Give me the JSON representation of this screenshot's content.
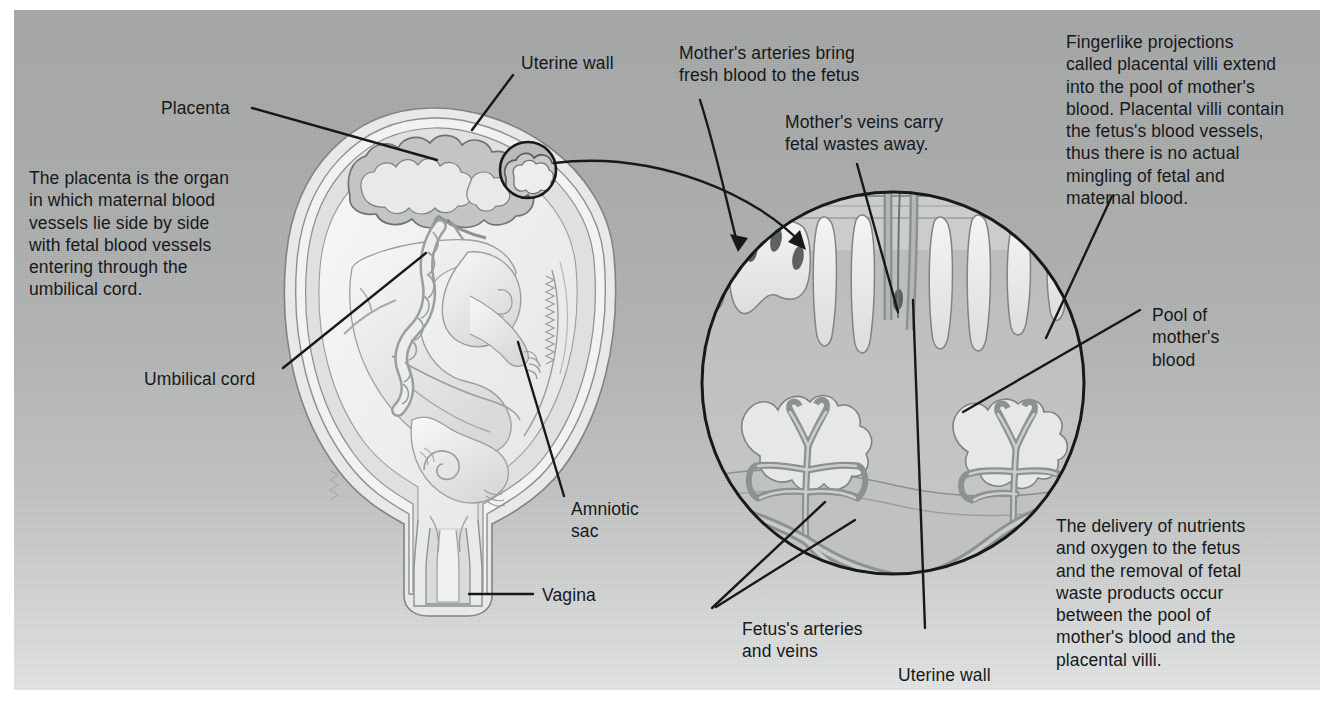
{
  "figure": {
    "title_absent": true,
    "background_color": "#b0b2b2",
    "ink_color": "#16181a"
  },
  "text_blocks": {
    "placenta_description": "The placenta is the organ\nin which maternal blood\nvessels lie side by side\nwith fetal blood vessels\nentering through the\numbilical cord.",
    "mothers_arteries": "Mother's arteries bring\nfresh blood to the fetus",
    "mothers_veins": "Mother's veins carry\nfetal wastes away.",
    "fingerlike_projections": "Fingerlike projections\ncalled placental villi extend\ninto the pool of mother's\nblood. Placental villi contain\nthe fetus's blood vessels,\nthus there is no actual\nmingling of fetal and\nmaternal blood.",
    "delivery_of_nutrients": "The delivery of nutrients\nand oxygen to the fetus\nand the removal of fetal\nwaste products occur\nbetween the pool of\nmother's blood and the\nplacental villi."
  },
  "labels": {
    "uterine_wall_left": "Uterine wall",
    "placenta": "Placenta",
    "umbilical_cord": "Umbilical cord",
    "amniotic_sac": "Amniotic\nsac",
    "vagina": "Vagina",
    "pool_of_mothers_blood": "Pool of\nmother's\nblood",
    "fetuss_arteries_and_veins": "Fetus's arteries\nand veins",
    "uterine_wall_detail": "Uterine wall"
  },
  "illustrations": {
    "uterus_cross_section": {
      "name": "uterus-with-fetus-cross-section",
      "contains": [
        "placenta",
        "uterine wall",
        "amniotic sac",
        "fetus",
        "umbilical cord",
        "vagina",
        "detail callout circle"
      ]
    },
    "magnified_detail": {
      "name": "placental-villi-magnified-circle",
      "contains": [
        "uterine wall band",
        "maternal arteries",
        "maternal veins",
        "placental villi",
        "pool of mother's blood",
        "fetal arteries and veins"
      ]
    }
  },
  "colors": {
    "panel_top": "#a6a8a8",
    "panel_bottom": "#e4e6e6",
    "tissue_light": "#edefee",
    "tissue_mid": "#c9cbca",
    "tissue_dark": "#9fa2a1",
    "outline": "#6e7271",
    "ink": "#16181a",
    "vessel": "#9a9d9c"
  }
}
